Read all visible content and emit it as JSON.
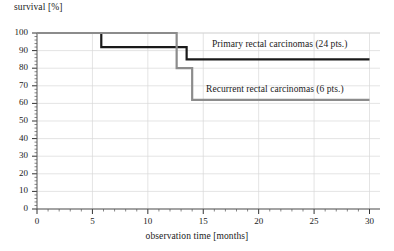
{
  "chart_data": {
    "type": "line",
    "title": "",
    "subtitle": "",
    "xlabel": "observation time [months]",
    "ylabel": "survival [%]",
    "xlim": [
      0,
      30
    ],
    "ylim": [
      0,
      100
    ],
    "xticks": [
      0,
      5,
      10,
      15,
      20,
      25,
      30
    ],
    "xtick_labels": [
      "0",
      "5",
      "10",
      "15",
      "20",
      "25",
      "30"
    ],
    "xminor_step": 1,
    "yticks": [
      0,
      10,
      20,
      30,
      40,
      50,
      60,
      70,
      80,
      90,
      100
    ],
    "ytick_labels": [
      "0",
      "10",
      "20",
      "30",
      "40",
      "50",
      "60",
      "70",
      "80",
      "90",
      "100"
    ],
    "yminor_step": 2,
    "grid": true,
    "grid_color": "#d8d8d8",
    "legend_position": "inline-annotations",
    "style": "kaplan-meier step curves",
    "series": [
      {
        "name": "Primary rectal carcinomas (24 pts.)",
        "label": "Primary rectal carcinomas (24 pts.)",
        "n_patients": 24,
        "color": "#1a1a1a",
        "line_width": 2.2,
        "steps": [
          {
            "x": 0,
            "y": 100
          },
          {
            "x": 5.8,
            "y": 100
          },
          {
            "x": 5.8,
            "y": 92
          },
          {
            "x": 13.5,
            "y": 92
          },
          {
            "x": 13.5,
            "y": 85
          },
          {
            "x": 30,
            "y": 85
          }
        ]
      },
      {
        "name": "Recurrent rectal carcinomas (6 pts.)",
        "label": "Recurrent rectal carcinomas (6 pts.)",
        "n_patients": 6,
        "color": "#8c8c8c",
        "line_width": 2.2,
        "steps": [
          {
            "x": 0,
            "y": 100
          },
          {
            "x": 12.6,
            "y": 100
          },
          {
            "x": 12.6,
            "y": 80
          },
          {
            "x": 14.0,
            "y": 80
          },
          {
            "x": 14.0,
            "y": 62
          },
          {
            "x": 30,
            "y": 62
          }
        ]
      }
    ],
    "annotations": [
      {
        "text": "Primary rectal carcinomas (24 pts.)",
        "x": 16,
        "y": 88
      },
      {
        "text": "Recurrent rectal carcinomas (6 pts.)",
        "x": 15.5,
        "y": 63
      }
    ]
  },
  "axes": {
    "y_title": "survival [%]",
    "x_title": "observation time [months]"
  }
}
